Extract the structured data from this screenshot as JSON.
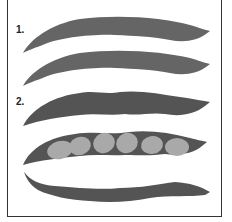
{
  "figure": {
    "groups": [
      {
        "label": "1.",
        "description": "two pods, smooth and slender",
        "pod_color": "#656565",
        "pods": 2
      },
      {
        "label": "2.",
        "description": "three pods, wider with bumpy edges; middle pod opened showing seeds",
        "pod_color": "#545454",
        "pods": 3,
        "seeds_in_open_pod": 6,
        "seed_color": "#a9a9a9"
      }
    ],
    "frame_color": "#333333"
  }
}
